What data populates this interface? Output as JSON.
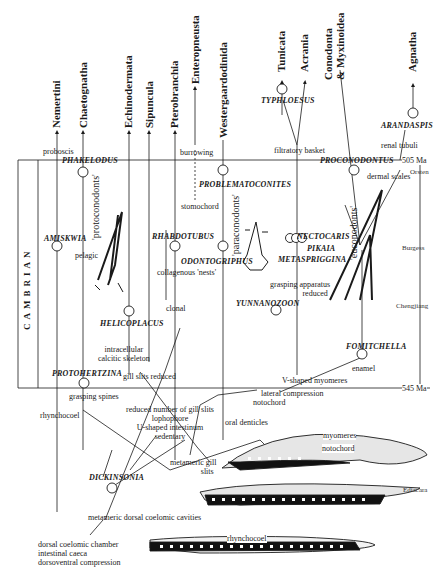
{
  "diagram": {
    "period": "CAMBRIAN",
    "boundaries": {
      "top": "505 Ma",
      "bottom": "545 Ma"
    },
    "strata": [
      "Orsten",
      "Burgess",
      "Chengjiang",
      "Ediacara"
    ],
    "terminal_taxa": [
      "Nemertini",
      "Chaetognatha",
      "Echinodermata",
      "Sipuncula",
      "Pterobranchia",
      "Enteropneusta",
      "Westergaardodinida",
      "Tunicata",
      "Acrania",
      "Conodonta",
      "& Myxinoidea",
      "Agnatha"
    ],
    "fossil_taxa": [
      "PHAKELODUS",
      "AMISKWIA",
      "HELICOPLACUS",
      "PROTOHERTZINA",
      "RHABDOTUBUS",
      "PROBLEMATOCONITES",
      "ODONTOGRIPHUS",
      "NECTOCARIS",
      "PIKAIA",
      "METASPRIGGINA",
      "YUNNANOZOON",
      "TYPHLOESUS",
      "PROCONODONTUS",
      "FOMITCHELLA",
      "ARANDASPIS",
      "DICKINSONIA"
    ],
    "groups": [
      "'protoconodonts'",
      "'paraconodonts'",
      "'euconodonts'"
    ],
    "characters": {
      "proboscis": "proboscis",
      "burrowing": "burrowing",
      "stomochord": "stomochord",
      "filtratory_basket": "filtratory basket",
      "renal_tubuli": "renal tubuli",
      "dermal_scales": "dermal scales",
      "pelagic": "pelagic",
      "collagenous_nests": "collagenous 'nests'",
      "clonal": "clonal",
      "grasping_apparatus_1": "grasping apparatus",
      "grasping_apparatus_2": "reduced",
      "intracellular_1": "intracellular",
      "intracellular_2": "calcitic skeleton",
      "gill_slits_reduced": "gill slits reduced",
      "grasping_spines": "grasping spines",
      "enamel": "enamel",
      "v_shaped": "V-shaped myomeres",
      "lateral_compression": "lateral compression",
      "notochord": "notochord",
      "rhynchocoel": "rhynchocoel",
      "reduced_gill_1": "reduced number of gill slits",
      "reduced_gill_2": "lophophore",
      "reduced_gill_3": "U-shaped intestinum",
      "reduced_gill_4": "sedentary",
      "oral_denticles": "oral denticles",
      "metameric_gill_1": "metameric gill",
      "metameric_gill_2": "slits",
      "metameric_dorsal": "metameric dorsal coelomic cavities",
      "dorsal_1": "dorsal coelomic chamber",
      "dorsal_2": "intestinal caeca",
      "dorsal_3": "dorsoventral compression"
    },
    "drawing_labels": {
      "myomeres": "myomeres",
      "notochord": "notochord",
      "rhynchocoel": "rhynchocoel"
    }
  }
}
